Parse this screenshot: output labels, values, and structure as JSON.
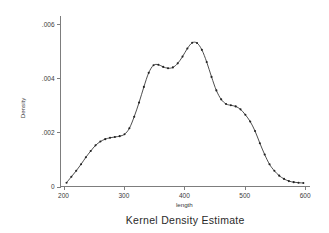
{
  "chart_data": {
    "type": "line",
    "title": "Kernel Density Estimate",
    "xlabel": "length",
    "ylabel": "Density",
    "xlim": [
      195,
      608
    ],
    "ylim": [
      0,
      0.0063
    ],
    "grid": false,
    "legend": null,
    "markers": "filled-circle",
    "xticks": [
      200,
      300,
      400,
      500,
      600
    ],
    "xticklabels": [
      "200",
      "300",
      "400",
      "500",
      "600"
    ],
    "yticks": [
      0,
      0.002,
      0.004,
      0.006
    ],
    "yticklabels": [
      "0",
      ".002",
      ".004",
      ".006"
    ],
    "series": [
      {
        "name": "Density",
        "x": [
          205,
          213,
          221,
          229,
          237,
          245,
          253,
          261,
          269,
          277,
          285,
          293,
          301,
          309,
          317,
          325,
          333,
          341,
          349,
          357,
          365,
          373,
          381,
          389,
          397,
          405,
          413,
          421,
          429,
          437,
          445,
          453,
          461,
          469,
          477,
          485,
          493,
          501,
          509,
          517,
          525,
          533,
          541,
          549,
          557,
          565,
          573,
          581,
          589,
          597
        ],
        "y": [
          0.00014,
          0.00036,
          0.00058,
          0.00082,
          0.00108,
          0.00131,
          0.00152,
          0.00166,
          0.00175,
          0.0018,
          0.00183,
          0.00186,
          0.00193,
          0.00215,
          0.00258,
          0.0031,
          0.00368,
          0.0042,
          0.00448,
          0.0045,
          0.00442,
          0.00437,
          0.0044,
          0.00455,
          0.0048,
          0.0051,
          0.00531,
          0.0053,
          0.00505,
          0.0046,
          0.00405,
          0.00355,
          0.00322,
          0.00305,
          0.003,
          0.00296,
          0.00285,
          0.00265,
          0.0024,
          0.00205,
          0.0016,
          0.00118,
          0.00082,
          0.00058,
          0.0004,
          0.00028,
          0.0002,
          0.00016,
          0.00014,
          0.00013
        ]
      }
    ]
  },
  "axes": {
    "y_axis_title": "Density",
    "x_axis_title": "length"
  },
  "title": "Kernel Density Estimate"
}
